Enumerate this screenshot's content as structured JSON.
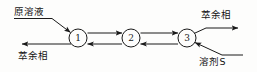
{
  "diagram": {
    "type": "process-flow",
    "title": "",
    "stages": [
      {
        "id": "1",
        "label": "1",
        "cx": 78,
        "cy": 38,
        "r": 9
      },
      {
        "id": "2",
        "label": "2",
        "cx": 131,
        "cy": 38,
        "r": 9
      },
      {
        "id": "3",
        "label": "3",
        "cx": 187,
        "cy": 38,
        "r": 9
      }
    ],
    "streams": {
      "feed": {
        "label": "原溶液",
        "direction": "into-stage-1",
        "position": "upper-left"
      },
      "raffinate_out": {
        "label": "萃余相",
        "direction": "out-of-stage-1",
        "position": "lower-left"
      },
      "extract_out": {
        "label": "萃余相",
        "direction": "out-of-stage-3",
        "position": "upper-right"
      },
      "solvent_in": {
        "label": "溶剂S",
        "direction": "into-stage-3",
        "position": "lower-right"
      }
    },
    "internal_flows": [
      {
        "from": "1",
        "to": "2",
        "row": "top",
        "arrow": "right"
      },
      {
        "from": "2",
        "to": "3",
        "row": "top",
        "arrow": "right"
      },
      {
        "from": "3",
        "to": "2",
        "row": "bottom",
        "arrow": "left"
      },
      {
        "from": "2",
        "to": "1",
        "row": "bottom",
        "arrow": "left"
      }
    ],
    "colors": {
      "line": "#1a1a1a",
      "text": "#141414",
      "background": "#fdfdfc"
    }
  }
}
